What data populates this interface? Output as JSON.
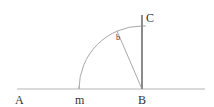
{
  "diagram": {
    "labels": {
      "A": "A",
      "m": "m",
      "B": "B",
      "C": "C",
      "b": "b"
    },
    "points": {
      "A": [
        17,
        89
      ],
      "m": [
        79,
        89
      ],
      "B": [
        142,
        89
      ],
      "C": [
        142,
        15
      ],
      "b": [
        118,
        31
      ]
    },
    "colors": {
      "line": "#b0b0b0",
      "perpendicular": "#8a8a8a",
      "label": "#333333"
    }
  }
}
